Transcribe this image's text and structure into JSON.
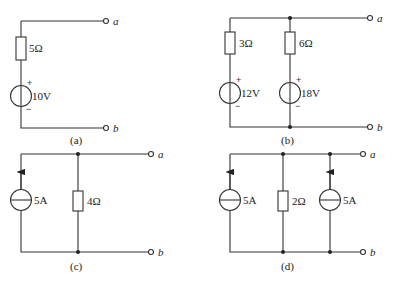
{
  "circuits": {
    "a": {
      "caption": "(a)",
      "resistor": "5Ω",
      "source": "10V",
      "plus": "+",
      "minus": "−",
      "term_a": "a",
      "term_b": "b"
    },
    "b": {
      "caption": "(b)",
      "r1": "3Ω",
      "r2": "6Ω",
      "v1": "12V",
      "v2": "18V",
      "plus": "+",
      "minus": "−",
      "term_a": "a",
      "term_b": "b"
    },
    "c": {
      "caption": "(c)",
      "isource": "5A",
      "resistor": "4Ω",
      "term_a": "a",
      "term_b": "b"
    },
    "d": {
      "caption": "(d)",
      "i1": "5A",
      "resistor": "2Ω",
      "i2": "5A",
      "term_a": "a",
      "term_b": "b"
    }
  },
  "colors": {
    "wire": "#333333",
    "text": "#222222",
    "background": "#ffffff"
  }
}
